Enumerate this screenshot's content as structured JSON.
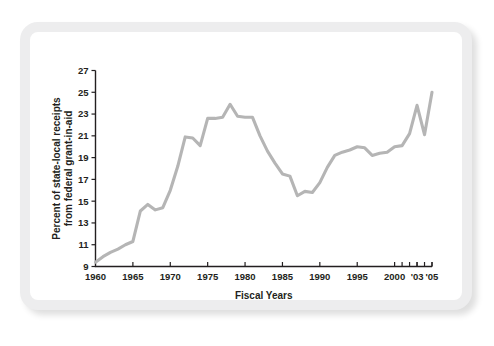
{
  "figure": {
    "frame_color": "#ededee",
    "background_color": "#ffffff",
    "line_color": "#b5b5b5",
    "axis_color": "#231f20"
  },
  "chart_data": {
    "type": "line",
    "title": "",
    "xlabel": "Fiscal Years",
    "ylabel": "Percent of state-local receipts from federal grant-in-aid",
    "ylabel_line1": "Percent of state-local receipts",
    "ylabel_line2": "from federal grant-in-aid",
    "grid": false,
    "legend": "none",
    "xlim": [
      1960,
      2005
    ],
    "ylim": [
      9,
      27
    ],
    "ytick_labels": [
      "9",
      "11",
      "13",
      "15",
      "17",
      "19",
      "21",
      "23",
      "25",
      "27"
    ],
    "yticks": [
      9,
      11,
      13,
      15,
      17,
      19,
      21,
      23,
      25,
      27
    ],
    "xtick_labels": [
      "1960",
      "1965",
      "1970",
      "1975",
      "1980",
      "1985",
      "1990",
      "1995",
      "2000",
      "'03",
      "'05"
    ],
    "xticks": [
      1960,
      1965,
      1970,
      1975,
      1980,
      1985,
      1990,
      1995,
      2000,
      2003,
      2005
    ],
    "xminor_ticks": [
      2001,
      2002,
      2003,
      2004,
      2005
    ],
    "series": [
      {
        "name": "Percent of state-local receipts from federal grant-in-aid",
        "x": [
          1960,
          1961,
          1962,
          1963,
          1964,
          1965,
          1966,
          1967,
          1968,
          1969,
          1970,
          1971,
          1972,
          1973,
          1974,
          1975,
          1976,
          1977,
          1978,
          1979,
          1980,
          1981,
          1982,
          1983,
          1984,
          1985,
          1986,
          1987,
          1988,
          1989,
          1990,
          1991,
          1992,
          1993,
          1994,
          1995,
          1996,
          1997,
          1998,
          1999,
          2000,
          2001,
          2002,
          2003,
          2004,
          2005
        ],
        "values": [
          9.4,
          9.9,
          10.3,
          10.6,
          11.0,
          11.3,
          14.1,
          14.7,
          14.2,
          14.4,
          16.0,
          18.2,
          20.9,
          20.8,
          20.1,
          22.6,
          22.6,
          22.7,
          23.9,
          22.8,
          22.7,
          22.7,
          21.0,
          19.6,
          18.5,
          17.5,
          17.3,
          15.5,
          15.9,
          15.8,
          16.7,
          18.1,
          19.2,
          19.5,
          19.7,
          20.0,
          19.9,
          19.2,
          19.4,
          19.5,
          20.0,
          20.1,
          21.2,
          23.8,
          21.1,
          25.0
        ]
      }
    ]
  }
}
